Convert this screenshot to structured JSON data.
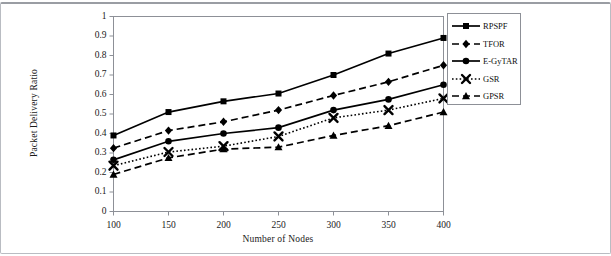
{
  "chart_data": {
    "type": "line",
    "title": "",
    "xlabel": "Number of Nodes",
    "ylabel": "Packet Delivery Ratio",
    "x": [
      100,
      150,
      200,
      250,
      300,
      350,
      400
    ],
    "xtick_labels": [
      "100",
      "150",
      "200",
      "250",
      "300",
      "350",
      "400"
    ],
    "ytick_labels": [
      "0",
      "0.1",
      "0.2",
      "0.3",
      "0.4",
      "0.5",
      "0.6",
      "0.7",
      "0.8",
      "0.9",
      "1"
    ],
    "ytick_values": [
      0,
      0.1,
      0.2,
      0.3,
      0.4,
      0.5,
      0.6,
      0.7,
      0.8,
      0.9,
      1
    ],
    "xlim": [
      100,
      400
    ],
    "ylim": [
      0,
      1
    ],
    "grid": false,
    "legend_position": "right-outside",
    "series": [
      {
        "name": "RPSPF",
        "marker": "square",
        "line_style": "solid",
        "color": "#000000",
        "values": [
          0.39,
          0.51,
          0.565,
          0.605,
          0.7,
          0.81,
          0.89
        ]
      },
      {
        "name": "TFOR",
        "marker": "diamond",
        "line_style": "dashed",
        "color": "#000000",
        "values": [
          0.325,
          0.415,
          0.46,
          0.52,
          0.595,
          0.665,
          0.75
        ]
      },
      {
        "name": "E-GyTAR",
        "marker": "circle",
        "line_style": "solid",
        "color": "#000000",
        "values": [
          0.265,
          0.36,
          0.4,
          0.43,
          0.52,
          0.575,
          0.65
        ]
      },
      {
        "name": "GSR",
        "marker": "x",
        "line_style": "dotted",
        "color": "#000000",
        "values": [
          0.235,
          0.305,
          0.335,
          0.385,
          0.48,
          0.52,
          0.58
        ]
      },
      {
        "name": "GPSR",
        "marker": "triangle",
        "line_style": "dashed",
        "color": "#000000",
        "values": [
          0.19,
          0.275,
          0.32,
          0.33,
          0.39,
          0.44,
          0.51
        ]
      }
    ]
  },
  "legend": {
    "items": [
      {
        "label": "RPSPF"
      },
      {
        "label": "TFOR"
      },
      {
        "label": "E-GyTAR"
      },
      {
        "label": "GSR"
      },
      {
        "label": "GPSR"
      }
    ]
  }
}
